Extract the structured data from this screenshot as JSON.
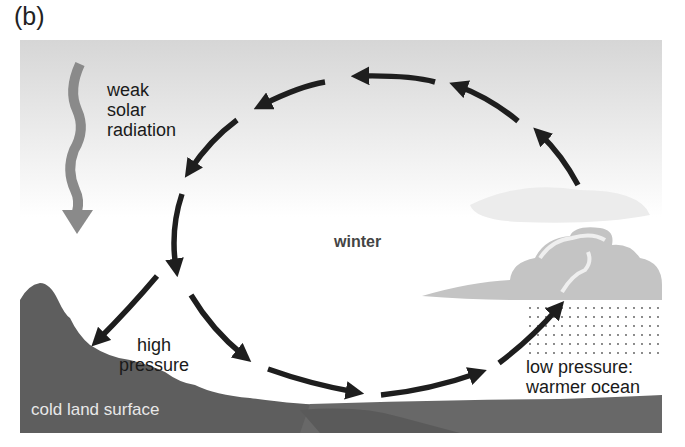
{
  "figure": {
    "panel_label": "(b)",
    "season": "winter",
    "labels": {
      "radiation": [
        "weak",
        "solar",
        "radiation"
      ],
      "high_pressure": [
        "high",
        "pressure"
      ],
      "low_pressure": [
        "low pressure:",
        "warmer ocean"
      ],
      "land": "cold land surface"
    },
    "colors": {
      "sky_top": "#d9d9d9",
      "sky_bottom": "#ffffff",
      "land": "#5e5e5e",
      "ocean": "#686868",
      "cloud": "#c4c4c4",
      "radiation_arrow": "#8a8a8a",
      "circulation_arrow": "#1e1e1e"
    }
  }
}
